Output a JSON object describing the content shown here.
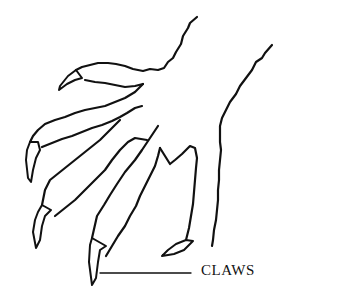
{
  "diagram": {
    "labels": [
      {
        "text": "CLAWS",
        "points_to": "claws"
      }
    ]
  }
}
